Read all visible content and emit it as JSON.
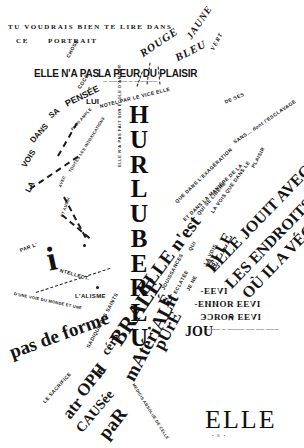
{
  "poster": {
    "publication": "ELLE",
    "publication_sub": "• R •",
    "background_color": "#ffffff",
    "text_color": "#141414"
  },
  "header": {
    "line1": "TU VOUDRAIS BIEN TE LIRE DANS",
    "line2_a": "CE",
    "line2_b": "PORTRAIT"
  },
  "headline": {
    "left": "ELLE N'A PAS",
    "right": "LA PEUR DU PLAISIR",
    "caption": "— —— —— — — ————"
  },
  "colors_fan": [
    {
      "label": "ROUGE"
    },
    {
      "label": "BLEU"
    },
    {
      "label": "JAUNE"
    },
    {
      "label": "VERT"
    }
  ],
  "center_word": {
    "text": "HURLUBERLU",
    "letters": [
      "H",
      "U",
      "R",
      "L",
      "U",
      "B",
      "E",
      "R",
      "L",
      "U"
    ],
    "side_note": "ELLE N'A PAS FAIT SON ÉCOLE D'AMOUR"
  },
  "upper_cluster": {
    "lui": "LUI",
    "coco": "COCO",
    "chose": "CHOSE",
    "note": "NOTEL PAR LE VICE ELLE",
    "de_ses": "DE SES"
  },
  "left_fan": {
    "words": [
      "LA",
      "VOIS",
      "DANS",
      "SA",
      "PENSÉE"
    ],
    "small_lines": [
      "PLUS AMPLE",
      "TOUTES LES INTOXICATIONS",
      "AVEC",
      "ET AUSSI"
    ]
  },
  "right_fan": {
    "lines": [
      "QUE DANS L'EXAGÉRATION",
      "ET DANS LA MANIÈRE DE LA",
      "QUI SE LIBÈRE",
      "LA VOIS QUE DANS LE",
      "SANS… dont l'ESCLAVAGE",
      "PLAISIR"
    ],
    "headline_big_1": "ELLE JOUIT AVEC",
    "headline_big_2": "LES ENDROITS",
    "headline_big_3": "OÙ IL A VÉCU"
  },
  "diagonal_column": {
    "main": "ELLE n'est",
    "small": [
      "JOUISSANCES",
      "ECLATÉE",
      "QUI",
      "JE NE",
      "LA VOIS"
    ],
    "elle": "ELLE"
  },
  "mirrored_block": {
    "line1": "IVƎƎ-",
    "line2": "IVƎƎ ЯОИИƎ-",
    "line3": "IVƎƎ คОЯCЄ"
  },
  "jou": {
    "word": "JOU",
    "trail": "— —— — ———— —— —— ———"
  },
  "intellect": {
    "par": "PAR L'",
    "i": "i",
    "ntellect": "NTELLECT.",
    "alisme": "L'ALISME",
    "under": "D'UNE VOIE DU MONDE ET UNE"
  },
  "bottom_words": {
    "pas_de_forme": "pas de forme",
    "sadique": "SADIQUE DES SAINTS",
    "cerebrale_a": "céré",
    "cerebrale_b": "BRALE",
    "materialite_a": "mAtériALit",
    "materialite_b": "É",
    "pure": "pUrE",
    "le_sacrifice": "LE SACRIFICE",
    "atrophie_a": "atr",
    "atrophie_b": "OPH",
    "atrophie_c": "ie",
    "causee": "CAUSée",
    "par": "paR",
    "medici": "MÉDICIS ABSOLUE DE CELLE"
  }
}
